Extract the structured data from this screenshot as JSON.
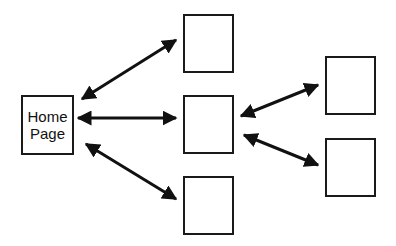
{
  "diagram": {
    "type": "site-hierarchy",
    "home": {
      "label_line1": "Home",
      "label_line2": "Page"
    },
    "nodes": [
      {
        "id": "home",
        "label": "Home Page"
      },
      {
        "id": "level1-top",
        "label": ""
      },
      {
        "id": "level1-middle",
        "label": ""
      },
      {
        "id": "level1-bottom",
        "label": ""
      },
      {
        "id": "level2-top",
        "label": ""
      },
      {
        "id": "level2-bottom",
        "label": ""
      }
    ],
    "edges": [
      {
        "from": "home",
        "to": "level1-top",
        "bidirectional": true
      },
      {
        "from": "home",
        "to": "level1-middle",
        "bidirectional": true
      },
      {
        "from": "home",
        "to": "level1-bottom",
        "bidirectional": true
      },
      {
        "from": "level1-middle",
        "to": "level2-top",
        "bidirectional": true
      },
      {
        "from": "level1-middle",
        "to": "level2-bottom",
        "bidirectional": true
      }
    ],
    "colors": {
      "stroke": "#1a1a1a",
      "background": "#ffffff"
    }
  }
}
